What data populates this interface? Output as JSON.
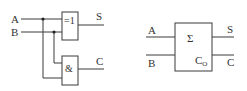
{
  "left_circuit": {
    "inputs": [
      {
        "label": "A"
      },
      {
        "label": "B"
      }
    ],
    "xor_gate": {
      "symbol": "=1"
    },
    "and_gate": {
      "symbol": "&"
    },
    "outputs": [
      {
        "label": "S"
      },
      {
        "label": "C"
      }
    ]
  },
  "right_block": {
    "inputs": [
      {
        "label": "A"
      },
      {
        "label": "B"
      }
    ],
    "sum_symbol": "Σ",
    "carry_symbol": "C",
    "carry_subscript": "O",
    "outputs": [
      {
        "label": "S"
      },
      {
        "label": "C"
      }
    ]
  },
  "colors": {
    "line": "#3a3a3a",
    "text": "#333333",
    "background": "#ffffff"
  }
}
